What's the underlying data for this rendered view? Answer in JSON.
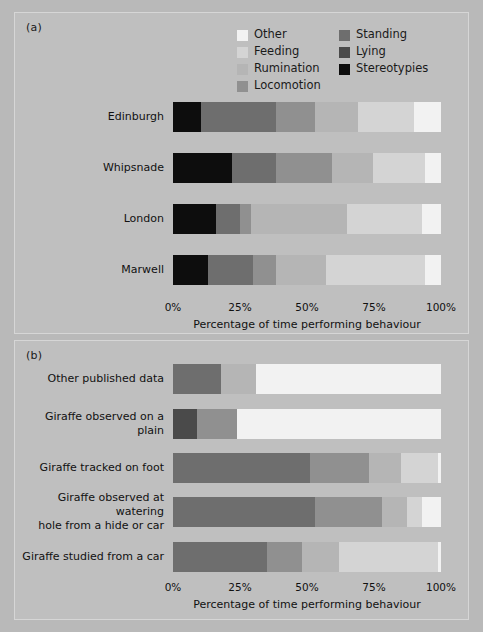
{
  "figure": {
    "background": "#b9b9b9",
    "panel_background": "#bfbfbf"
  },
  "panels": {
    "a": {
      "label": "(a)"
    },
    "b": {
      "label": "(b)"
    }
  },
  "legend": {
    "items": [
      {
        "label": "Other",
        "color": "#f2f2f2"
      },
      {
        "label": "Standing",
        "color": "#6e6e6e"
      },
      {
        "label": "Feeding",
        "color": "#d4d4d4"
      },
      {
        "label": "Lying",
        "color": "#4a4a4a"
      },
      {
        "label": "Rumination",
        "color": "#b5b5b5"
      },
      {
        "label": "Stereotypies",
        "color": "#0d0d0d"
      },
      {
        "label": "Locomotion",
        "color": "#909090"
      }
    ]
  },
  "axis": {
    "ticks": [
      "0%",
      "25%",
      "50%",
      "75%",
      "100%"
    ],
    "tick_values": [
      0,
      25,
      50,
      75,
      100
    ],
    "title": "Percentage of time performing behaviour",
    "min": 0,
    "max": 100
  },
  "chart_data": [
    {
      "type": "bar",
      "orientation": "horizontal",
      "stacked": true,
      "panel": "(a)",
      "title": "",
      "xlabel": "Percentage of time performing behaviour",
      "ylabel": "",
      "xlim": [
        0,
        100
      ],
      "grid": false,
      "legend_position": "top-center",
      "categories": [
        "Edinburgh",
        "Whipsnade",
        "London",
        "Marwell"
      ],
      "series": [
        {
          "name": "Stereotypies",
          "color": "#0d0d0d",
          "values": [
            10.5,
            22.0,
            16.0,
            13.0
          ]
        },
        {
          "name": "Lying",
          "color": "#4a4a4a",
          "values": [
            0.0,
            0.0,
            0.0,
            0.0
          ]
        },
        {
          "name": "Standing",
          "color": "#6e6e6e",
          "values": [
            28.0,
            16.5,
            9.0,
            17.0
          ]
        },
        {
          "name": "Locomotion",
          "color": "#909090",
          "values": [
            14.5,
            21.0,
            4.0,
            8.5
          ]
        },
        {
          "name": "Rumination",
          "color": "#b5b5b5",
          "values": [
            16.0,
            15.0,
            36.0,
            18.5
          ]
        },
        {
          "name": "Feeding",
          "color": "#d4d4d4",
          "values": [
            21.0,
            19.5,
            28.0,
            37.0
          ]
        },
        {
          "name": "Other",
          "color": "#f2f2f2",
          "values": [
            10.0,
            6.0,
            7.0,
            6.0
          ]
        }
      ]
    },
    {
      "type": "bar",
      "orientation": "horizontal",
      "stacked": true,
      "panel": "(b)",
      "title": "",
      "xlabel": "Percentage of time performing behaviour",
      "ylabel": "",
      "xlim": [
        0,
        100
      ],
      "grid": false,
      "legend_position": "none",
      "categories": [
        "Other published data",
        "Giraffe observed on a plain",
        "Giraffe tracked on foot",
        "Giraffe observed at watering hole from a hide or car",
        "Giraffe studied from a car"
      ],
      "series": [
        {
          "name": "Stereotypies",
          "color": "#0d0d0d",
          "values": [
            0.0,
            0.0,
            0.0,
            0.0,
            0.0
          ]
        },
        {
          "name": "Lying",
          "color": "#4a4a4a",
          "values": [
            0.0,
            9.0,
            0.0,
            0.0,
            0.0
          ]
        },
        {
          "name": "Standing",
          "color": "#6e6e6e",
          "values": [
            18.0,
            0.0,
            51.0,
            53.0,
            35.0
          ]
        },
        {
          "name": "Locomotion",
          "color": "#909090",
          "values": [
            0.0,
            15.0,
            22.0,
            25.0,
            13.0
          ]
        },
        {
          "name": "Rumination",
          "color": "#b5b5b5",
          "values": [
            13.0,
            0.0,
            12.0,
            9.5,
            14.0
          ]
        },
        {
          "name": "Feeding",
          "color": "#d4d4d4",
          "values": [
            0.0,
            0.0,
            14.0,
            5.5,
            37.0
          ]
        },
        {
          "name": "Other",
          "color": "#f2f2f2",
          "values": [
            69.0,
            76.0,
            1.0,
            7.0,
            1.0
          ]
        }
      ]
    }
  ]
}
